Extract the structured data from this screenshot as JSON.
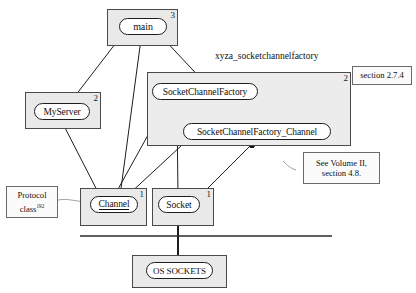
{
  "diagram": {
    "colors": {
      "container_fill": "#e9e9e9",
      "package_fill": "#ececec",
      "node_fill": "#ffffff",
      "stroke": "#1d1d1d",
      "note_fill": "#fbfbfb",
      "page_background": "#ffffff"
    }
  },
  "package": {
    "label": "xyza_socketchannelfactory",
    "multiplicity": "2"
  },
  "containers": [
    {
      "id": "main",
      "multiplicity": "3"
    },
    {
      "id": "myserver",
      "multiplicity": "2"
    },
    {
      "id": "channel",
      "multiplicity": "1"
    },
    {
      "id": "socket",
      "multiplicity": "1"
    },
    {
      "id": "ossockets",
      "multiplicity": ""
    }
  ],
  "nodes": [
    {
      "id": "main",
      "label": "main"
    },
    {
      "id": "myserver",
      "label": "MyServer"
    },
    {
      "id": "scf",
      "label": "SocketChannelFactory"
    },
    {
      "id": "scfc",
      "label": "SocketChannelFactory_Channel"
    },
    {
      "id": "channel",
      "label": "Channel"
    },
    {
      "id": "socket",
      "label": "Socket"
    },
    {
      "id": "os",
      "label": "OS SOCKETS"
    }
  ],
  "notes": [
    {
      "id": "note-protocol",
      "line1": "Protocol",
      "line2": "class",
      "superscript": "192"
    },
    {
      "id": "note-section",
      "line1": "section 2.7.4",
      "line2": ""
    },
    {
      "id": "note-volume",
      "line1": "See Volume II,",
      "line2": "section 4.8."
    }
  ]
}
